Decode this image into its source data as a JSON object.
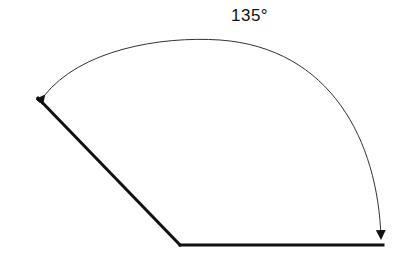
{
  "diagram": {
    "type": "angle",
    "angle_label": "135°",
    "angle_degrees": 135,
    "colors": {
      "ray": "#111111",
      "arc": "#333333",
      "label": "#111111",
      "background": "#ffffff"
    }
  }
}
